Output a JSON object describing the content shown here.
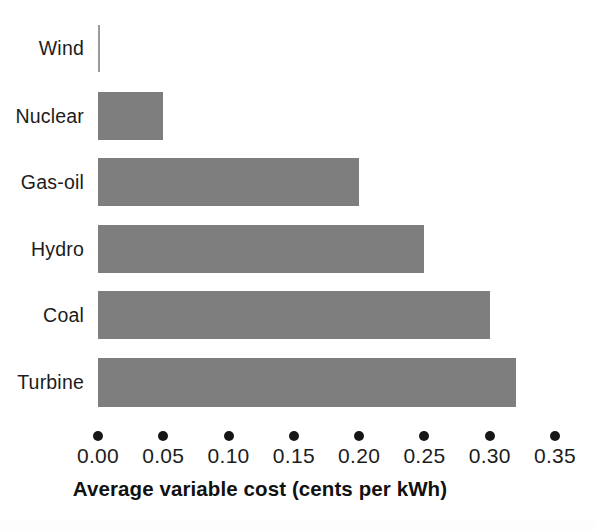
{
  "chart_data": {
    "type": "bar",
    "orientation": "horizontal",
    "title": "",
    "xlabel": "Average variable cost (cents per kWh)",
    "ylabel": "",
    "categories": [
      "Wind",
      "Nuclear",
      "Gas-oil",
      "Hydro",
      "Coal",
      "Turbine"
    ],
    "values": [
      0.0,
      0.05,
      0.2,
      0.25,
      0.3,
      0.32
    ],
    "xlim": [
      0.0,
      0.35
    ],
    "xticks": [
      0.0,
      0.05,
      0.1,
      0.15,
      0.2,
      0.25,
      0.3,
      0.35
    ],
    "xtick_labels": [
      "0.00",
      "0.05",
      "0.10",
      "0.15",
      "0.20",
      "0.25",
      "0.30",
      "0.35"
    ],
    "grid": false,
    "legend": false,
    "legend_position": "none",
    "bar_color": "#7e7e7e",
    "tick_marker": "dot",
    "tick_marker_color": "#161616",
    "bars": [
      {
        "category": "Wind",
        "value": 0.0,
        "label": "Wind"
      },
      {
        "category": "Nuclear",
        "value": 0.05,
        "label": "Nuclear"
      },
      {
        "category": "Gas-oil",
        "value": 0.2,
        "label": "Gas-oil"
      },
      {
        "category": "Hydro",
        "value": 0.25,
        "label": "Hydro"
      },
      {
        "category": "Coal",
        "value": 0.3,
        "label": "Coal"
      },
      {
        "category": "Turbine",
        "value": 0.32,
        "label": "Turbine"
      }
    ]
  },
  "colors": {
    "bar": "#7e7e7e",
    "text": "#1c1c1c",
    "dot": "#161616",
    "background": "#ffffff"
  }
}
